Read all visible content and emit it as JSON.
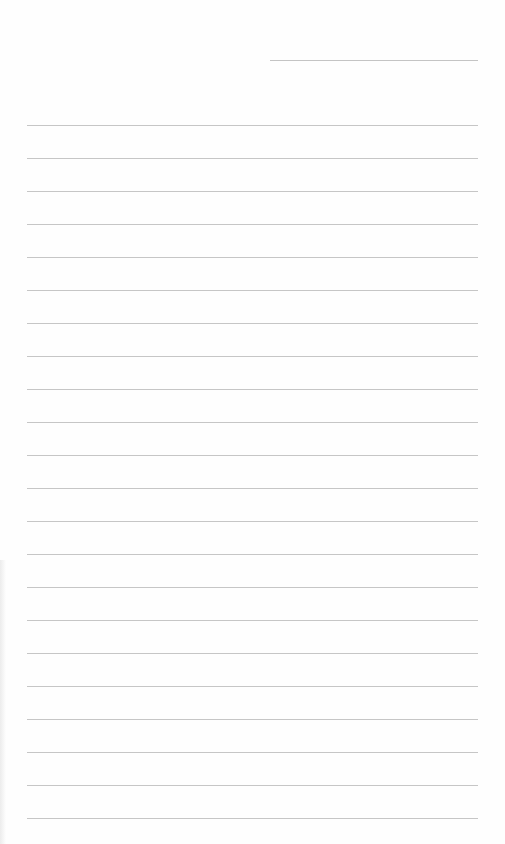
{
  "page": {
    "type": "lined-paper",
    "background_color": "#fefefe",
    "line_color": "#c6c6c6",
    "header_line": {
      "top": 60,
      "left": 270,
      "width": 208
    },
    "rules": {
      "first_top": 125,
      "spacing": 33,
      "count": 22,
      "left": 27,
      "width": 451
    },
    "lines_text": [
      "",
      "",
      "",
      "",
      "",
      "",
      "",
      "",
      "",
      "",
      "",
      "",
      "",
      "",
      "",
      "",
      "",
      "",
      "",
      "",
      "",
      ""
    ]
  }
}
